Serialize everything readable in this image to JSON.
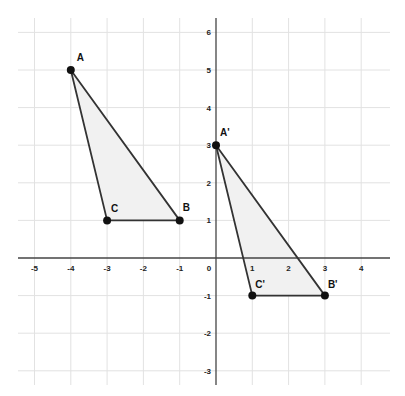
{
  "chart_data": {
    "type": "scatter",
    "title": "",
    "xlabel": "",
    "ylabel": "",
    "xlim": [
      -5.5,
      4.75
    ],
    "ylim": [
      -3.3,
      6.4
    ],
    "grid": true,
    "x_ticks": [
      -5,
      -4,
      -3,
      -2,
      -1,
      0,
      1,
      2,
      3,
      4
    ],
    "y_ticks": [
      6,
      5,
      4,
      3,
      2,
      1,
      -1,
      -2,
      -3
    ],
    "polygons": [
      {
        "name": "Triangle ABC",
        "vertices": [
          {
            "label": "A",
            "x": -4,
            "y": 5
          },
          {
            "label": "B",
            "x": -1,
            "y": 1
          },
          {
            "label": "C",
            "x": -3,
            "y": 1
          }
        ]
      },
      {
        "name": "Triangle A'B'C'",
        "vertices": [
          {
            "label": "A'",
            "x": 0,
            "y": 3
          },
          {
            "label": "B'",
            "x": 3,
            "y": -1
          },
          {
            "label": "C'",
            "x": 1,
            "y": -1
          }
        ]
      }
    ]
  },
  "style": {
    "grid_color": "#e2e2e2",
    "axis_color": "#444444",
    "edge_color": "#333333",
    "fill_color": "#f1f1f1",
    "point_color": "#111111"
  },
  "layout": {
    "origin_px": [
      216,
      258
    ],
    "unit_x_px": 36.3,
    "unit_y_px": 37.6,
    "grid_px": {
      "left": 18,
      "right": 390,
      "top": 18,
      "bottom": 385
    }
  },
  "label_offsets": {
    "A": [
      6,
      -9
    ],
    "B": [
      3,
      -9
    ],
    "C": [
      4,
      -8
    ],
    "A'": [
      4,
      -9
    ],
    "B'": [
      3,
      -8
    ],
    "C'": [
      3,
      -8
    ]
  }
}
